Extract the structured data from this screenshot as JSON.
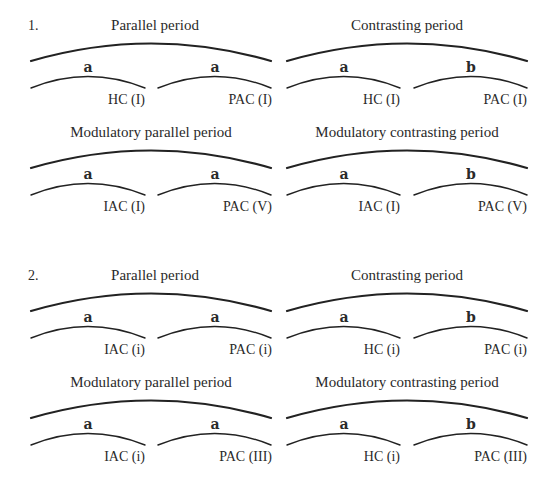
{
  "examples": [
    {
      "number": "1.",
      "diagrams": [
        {
          "title": "Parallel period",
          "phrases": [
            "a",
            "a"
          ],
          "cadences": [
            "HC (I)",
            "PAC (I)"
          ]
        },
        {
          "title": "Contrasting period",
          "phrases": [
            "a",
            "b"
          ],
          "cadences": [
            "HC (I)",
            "PAC (I)"
          ]
        },
        {
          "title": "Modulatory parallel period",
          "phrases": [
            "a",
            "a"
          ],
          "cadences": [
            "IAC (I)",
            "PAC (V)"
          ]
        },
        {
          "title": "Modulatory contrasting period",
          "phrases": [
            "a",
            "b"
          ],
          "cadences": [
            "IAC (I)",
            "PAC (V)"
          ]
        }
      ]
    },
    {
      "number": "2.",
      "diagrams": [
        {
          "title": "Parallel period",
          "phrases": [
            "a",
            "a"
          ],
          "cadences": [
            "IAC (i)",
            "PAC (i)"
          ]
        },
        {
          "title": "Contrasting period",
          "phrases": [
            "a",
            "b"
          ],
          "cadences": [
            "HC (i)",
            "PAC (i)"
          ]
        },
        {
          "title": "Modulatory parallel period",
          "phrases": [
            "a",
            "a"
          ],
          "cadences": [
            "IAC (i)",
            "PAC (III)"
          ]
        },
        {
          "title": "Modulatory contrasting period",
          "phrases": [
            "a",
            "b"
          ],
          "cadences": [
            "HC (i)",
            "PAC (III)"
          ]
        }
      ]
    }
  ]
}
